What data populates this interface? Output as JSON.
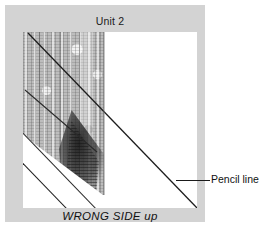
{
  "figure": {
    "title": "Unit 2",
    "caption": "WRONG SIDE up",
    "callout": {
      "label": "Pencil line",
      "leader_icon": "leader-line-icon"
    },
    "colors": {
      "mount": "#d3d3d3",
      "paper": "#ffffff",
      "fabric": "#bdbdbd",
      "ink": "#1a1a1a",
      "shadow": "#141414"
    },
    "elements": {
      "fabric_swatch": "fabric-swatch",
      "dark_shadow": "dark-shadow-region",
      "fold_band": "folded-edge-band",
      "main_pencil_line": "main-diagonal-pencil-line",
      "secondary_pencil_line": "secondary-diagonal-pencil-line"
    }
  }
}
